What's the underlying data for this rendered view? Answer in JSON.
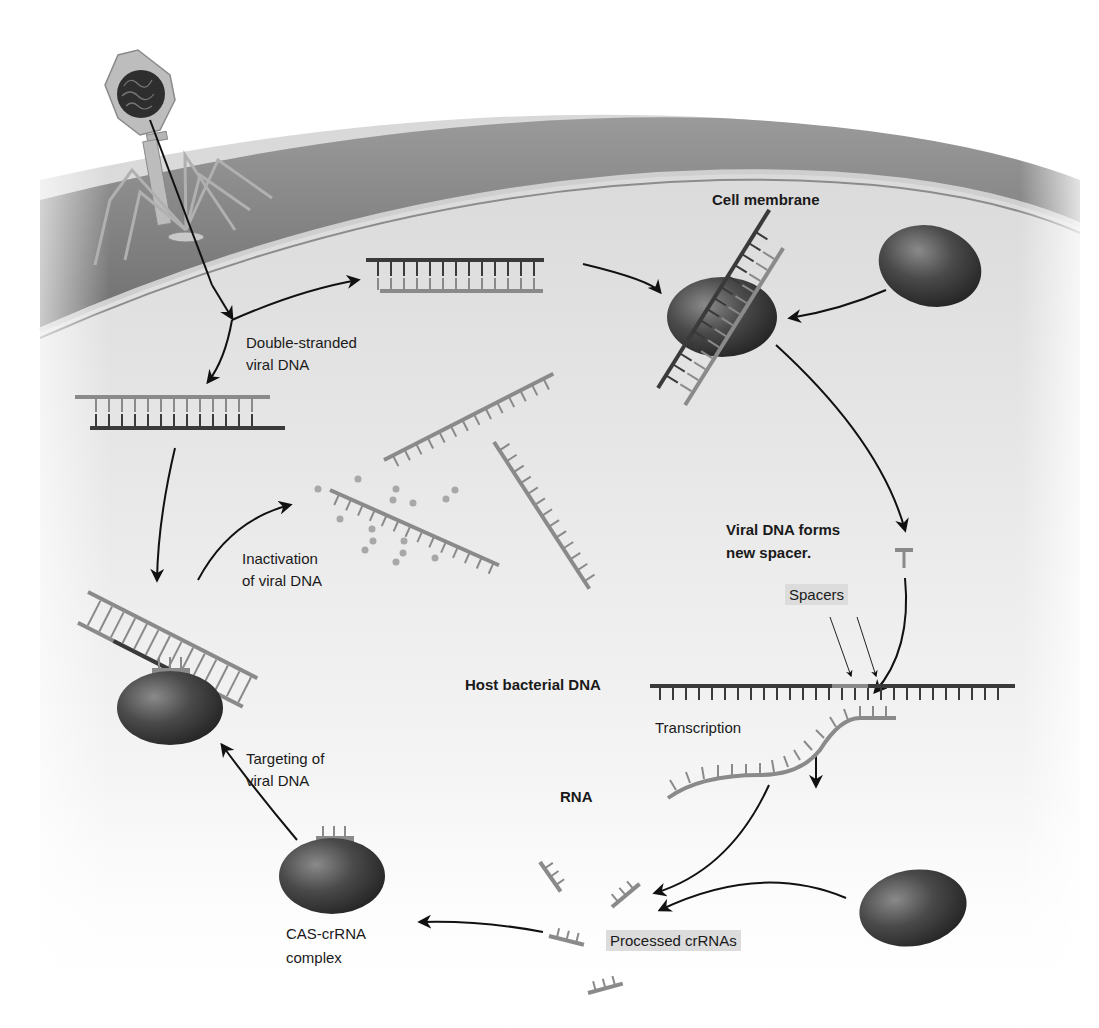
{
  "figure": {
    "colors": {
      "background": "#ffffff",
      "cell_wall": "#7a7a7a",
      "cell_membrane_band": "#c8c8c8",
      "cytoplasm": "#e6e6e6",
      "dna_dark_strand": "#3a3a3a",
      "dna_light_strand": "#8a8a8a",
      "cas_protein": "#404040",
      "label_box": "#dcdcdc",
      "arrow": "#111111"
    }
  },
  "labels": {
    "cell_membrane": "Cell membrane",
    "double_stranded_line1": "Double-stranded",
    "double_stranded_line2": "viral DNA",
    "inactivation_line1": "Inactivation",
    "inactivation_line2": "of viral DNA",
    "viral_spacer_line1": "Viral DNA forms",
    "viral_spacer_line2": "new spacer.",
    "spacers": "Spacers",
    "host_dna": "Host bacterial DNA",
    "transcription": "Transcription",
    "rna": "RNA",
    "targeting_line1": "Targeting of",
    "targeting_line2": "viral DNA",
    "cas_complex_line1": "CAS-crRNA",
    "cas_complex_line2": "complex",
    "processed_crrnas": "Processed crRNAs"
  },
  "elements": [
    {
      "id": "bacteriophage",
      "type": "virus"
    },
    {
      "id": "cell-wall",
      "type": "membrane"
    },
    {
      "id": "viral-dsdna-top",
      "type": "double-stranded DNA"
    },
    {
      "id": "viral-dsdna-left",
      "type": "double-stranded DNA"
    },
    {
      "id": "cas-protein-capturing",
      "type": "protein"
    },
    {
      "id": "cas-protein-free-top",
      "type": "protein"
    },
    {
      "id": "degraded-dna-fragments",
      "type": "DNA fragments"
    },
    {
      "id": "new-spacer",
      "type": "DNA fragment"
    },
    {
      "id": "host-bacterial-dna",
      "type": "DNA"
    },
    {
      "id": "rna-transcript",
      "type": "RNA"
    },
    {
      "id": "processed-crrnas",
      "type": "RNA fragments",
      "count": 4
    },
    {
      "id": "cas-protein-free-bottom",
      "type": "protein"
    },
    {
      "id": "cas-crrna-complex",
      "type": "protein-RNA complex"
    },
    {
      "id": "cas-targeting-complex",
      "type": "protein-RNA complex"
    }
  ]
}
